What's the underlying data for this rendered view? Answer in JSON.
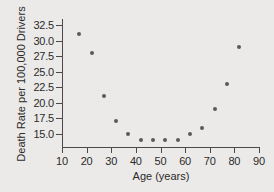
{
  "chart_data": {
    "type": "scatter",
    "title": "",
    "xlabel": "Age (years)",
    "ylabel": "Death Rate per 100,000 Drivers",
    "xlim": [
      10,
      90
    ],
    "ylim": [
      13.6,
      33.2
    ],
    "xticks": [
      "10",
      "20",
      "30",
      "40",
      "50",
      "60",
      "70",
      "80",
      "90"
    ],
    "yticks": [
      "15.0",
      "17.5",
      "20.0",
      "22.5",
      "25.0",
      "27.5",
      "30.0",
      "32.5"
    ],
    "grid": false,
    "legend": null,
    "x": [
      17,
      22,
      27,
      32,
      37,
      42,
      47,
      52,
      57,
      62,
      67,
      72,
      77,
      82
    ],
    "y": [
      31,
      28,
      21,
      17,
      15,
      14,
      14,
      14,
      14,
      15,
      16,
      19,
      23,
      29
    ],
    "points": [
      {
        "x": 17,
        "y": 31
      },
      {
        "x": 22,
        "y": 28
      },
      {
        "x": 27,
        "y": 21
      },
      {
        "x": 32,
        "y": 17
      },
      {
        "x": 37,
        "y": 15
      },
      {
        "x": 42,
        "y": 14
      },
      {
        "x": 47,
        "y": 14
      },
      {
        "x": 52,
        "y": 14
      },
      {
        "x": 57,
        "y": 14
      },
      {
        "x": 62,
        "y": 15
      },
      {
        "x": 67,
        "y": 16
      },
      {
        "x": 72,
        "y": 19
      },
      {
        "x": 77,
        "y": 23
      },
      {
        "x": 82,
        "y": 29
      }
    ],
    "marker_color": "#5a5a5a",
    "axis_color": "#4a4a4a",
    "background_color": "#eceae8"
  }
}
